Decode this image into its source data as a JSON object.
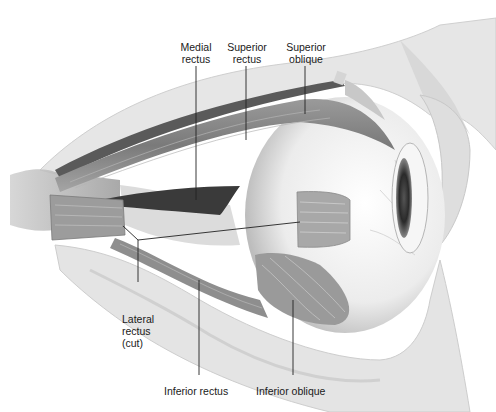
{
  "labels": {
    "medial_rectus": "Medial\nrectus",
    "superior_rectus": "Superior\nrectus",
    "superior_oblique": "Superior\noblique",
    "lateral_rectus": "Lateral\nrectus\n(cut)",
    "inferior_rectus": "Inferior rectus",
    "inferior_oblique": "Inferior oblique"
  },
  "colors": {
    "bone": "#e4e4e4",
    "bone_edge": "#c8c8c8",
    "muscle": "#8a8a8a",
    "muscle_dark": "#4a4a4a",
    "eyeball": "#f2f2f2",
    "leader": "#222222"
  }
}
